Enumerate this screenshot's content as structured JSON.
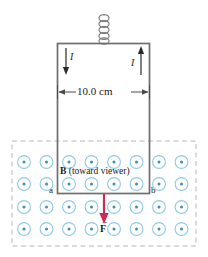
{
  "figure": {
    "dimension": {
      "label": "10.0 cm",
      "value": 10.0,
      "unit": "cm"
    },
    "current": {
      "left_label": "I",
      "right_label": "I",
      "left_direction": "down",
      "right_direction": "up"
    },
    "nodes": {
      "left": "a",
      "right": "b"
    },
    "bfield": {
      "symbol": "B",
      "note": "(toward viewer)",
      "direction": "out-of-page",
      "dot_rows": 4,
      "dot_cols": 8
    },
    "force": {
      "symbol": "F",
      "direction": "down"
    },
    "colors": {
      "wire": "#6e6e6e",
      "field_circle": "#8ecae6",
      "field_dot": "#3b8fb5",
      "force_arrow": "#cc2b52",
      "dashed_border": "#b8b8b8",
      "text": "#1a1a1a",
      "spring": "#7a7a7a"
    }
  }
}
